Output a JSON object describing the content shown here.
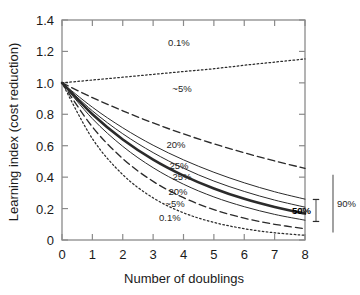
{
  "chart_data": {
    "type": "line",
    "title": "",
    "xlabel": "Number of doublings",
    "ylabel": "Learning index (cost reduction)",
    "xlim": [
      0,
      8
    ],
    "ylim": [
      0,
      1.4
    ],
    "xticks": [
      "0",
      "1",
      "2",
      "3",
      "4",
      "5",
      "6",
      "7",
      "8"
    ],
    "yticks": [
      "0",
      "0.2",
      "0.4",
      "0.6",
      "0.8",
      "1.0",
      "1.2",
      "1.4"
    ],
    "grid": false,
    "legend": "none",
    "x": [
      0,
      1,
      2,
      3,
      4,
      5,
      6,
      7,
      8
    ],
    "series": [
      {
        "name": "0.1% upper",
        "style": "dotted",
        "label": "0.1%",
        "values": [
          1.0,
          1.018,
          1.036,
          1.054,
          1.072,
          1.09,
          1.112,
          1.132,
          1.152
        ]
      },
      {
        "name": "~5% upper",
        "style": "dashed",
        "label": "~5%",
        "values": [
          1.0,
          0.906,
          0.822,
          0.745,
          0.675,
          0.612,
          0.555,
          0.503,
          0.456
        ]
      },
      {
        "name": "20% upper",
        "style": "solid-thin",
        "label": "20%",
        "values": [
          1.0,
          0.845,
          0.714,
          0.603,
          0.51,
          0.431,
          0.364,
          0.307,
          0.26
        ]
      },
      {
        "name": "25% upper",
        "style": "solid-thin",
        "label": "25%",
        "values": [
          1.0,
          0.822,
          0.676,
          0.556,
          0.457,
          0.375,
          0.309,
          0.254,
          0.209
        ]
      },
      {
        "name": "50% median",
        "style": "solid-thick",
        "label": "50%",
        "values": [
          1.0,
          0.8,
          0.64,
          0.512,
          0.41,
          0.328,
          0.262,
          0.21,
          0.168
        ]
      },
      {
        "name": "25% lower",
        "style": "solid-thin",
        "label": "25%",
        "values": [
          1.0,
          0.772,
          0.596,
          0.46,
          0.355,
          0.274,
          0.212,
          0.163,
          0.126
        ]
      },
      {
        "name": "20% lower",
        "style": "dashed",
        "label": "20%",
        "values": [
          1.0,
          0.72,
          0.518,
          0.373,
          0.269,
          0.193,
          0.139,
          0.1,
          0.072
        ]
      },
      {
        "name": "0.1% lower",
        "style": "dotted",
        "label": "0.1%",
        "values": [
          1.0,
          0.645,
          0.416,
          0.268,
          0.173,
          0.112,
          0.072,
          0.046,
          0.03
        ]
      }
    ],
    "inline_annotations": [
      {
        "text": "0.1%",
        "x": 3.85,
        "y": 1.235,
        "bold": false
      },
      {
        "text": "~5%",
        "x": 3.95,
        "y": 0.945,
        "bold": false
      },
      {
        "text": "20%",
        "x": 3.75,
        "y": 0.583,
        "bold": false
      },
      {
        "text": "25%",
        "x": 3.85,
        "y": 0.452,
        "bold": false
      },
      {
        "text": "25%",
        "x": 3.95,
        "y": 0.382,
        "bold": false
      },
      {
        "text": "20%",
        "x": 3.82,
        "y": 0.288,
        "bold": false
      },
      {
        "text": "~5%",
        "x": 3.72,
        "y": 0.208,
        "bold": false
      },
      {
        "text": "0.1%",
        "x": 3.55,
        "y": 0.118,
        "bold": false
      }
    ],
    "range_bars": [
      {
        "name": "50% interval",
        "label": "50%",
        "low": 0.118,
        "high": 0.258,
        "bold": true
      },
      {
        "name": "90% interval",
        "label": "90%",
        "low": 0.048,
        "high": 0.415,
        "bold": false
      }
    ]
  }
}
